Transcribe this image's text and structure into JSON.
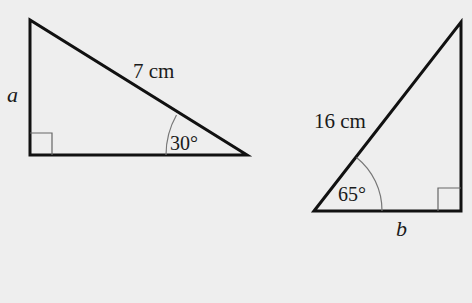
{
  "figure": {
    "background": "#eeeeee",
    "line_color": "#111111",
    "thin_line_color": "#666666",
    "triangles": [
      {
        "id": "left",
        "vertices": {
          "top": [
            30,
            20
          ],
          "right_angle": [
            30,
            155
          ],
          "angle_vertex": [
            247,
            155
          ]
        },
        "hypotenuse_label": "7 cm",
        "side_label": "a",
        "angle_label": "30°",
        "right_angle_marker": true
      },
      {
        "id": "right",
        "vertices": {
          "angle_vertex": [
            314,
            211
          ],
          "top": [
            461,
            22
          ],
          "right_angle": [
            461,
            211
          ]
        },
        "hypotenuse_label": "16 cm",
        "side_label": "b",
        "angle_label": "65°",
        "right_angle_marker": true
      }
    ]
  }
}
